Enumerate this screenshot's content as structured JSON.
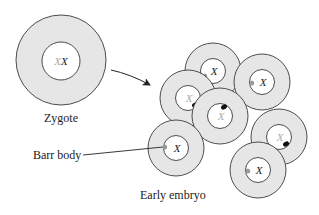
{
  "labels": {
    "zygote": "Zygote",
    "barr_body": "Barr body",
    "early_embryo": "Early embryo"
  },
  "colors": {
    "cytoplasm": "#e6e6e6",
    "nucleus": "#ffffff",
    "outline": "#3a3a3a",
    "active_x": "#222222",
    "inactive_x": "#aaaaaa",
    "barr_body_paternal": "#999999",
    "barr_body_maternal": "#111111"
  },
  "zygote": {
    "cx": 61,
    "cy": 60,
    "r_outer": 45,
    "r_inner": 20,
    "chromosomes": [
      {
        "text": "X",
        "color": "#aaaaaa"
      },
      {
        "text": "X",
        "color": "#222222"
      }
    ]
  },
  "embryo_cells": [
    {
      "id": "top",
      "cx": 213,
      "cy": 71,
      "x_text": "X",
      "x_color": "#222222",
      "barr": "gray",
      "barr_dx": -8,
      "barr_dy": 5
    },
    {
      "id": "upper-right",
      "cx": 262,
      "cy": 82,
      "x_text": "X",
      "x_color": "#222222",
      "barr": "gray",
      "barr_dx": -10,
      "barr_dy": 1
    },
    {
      "id": "left",
      "cx": 188,
      "cy": 98,
      "x_text": "X",
      "x_color": "#aaaaaa",
      "barr": "black",
      "barr_dx": 7,
      "barr_dy": 7
    },
    {
      "id": "center",
      "cx": 220,
      "cy": 116,
      "x_text": "X",
      "x_color": "#aaaaaa",
      "barr": "black",
      "barr_dx": 4,
      "barr_dy": -9
    },
    {
      "id": "right",
      "cx": 279,
      "cy": 137,
      "x_text": "X",
      "x_color": "#aaaaaa",
      "barr": "black",
      "barr_dx": 7,
      "barr_dy": 7
    },
    {
      "id": "lower-left",
      "cx": 176,
      "cy": 148,
      "x_text": "X",
      "x_color": "#222222",
      "barr": "gray",
      "barr_dx": -11,
      "barr_dy": -1
    },
    {
      "id": "bottom",
      "cx": 258,
      "cy": 170,
      "x_text": "X",
      "x_color": "#222222",
      "barr": "gray",
      "barr_dx": -10,
      "barr_dy": 1
    }
  ]
}
